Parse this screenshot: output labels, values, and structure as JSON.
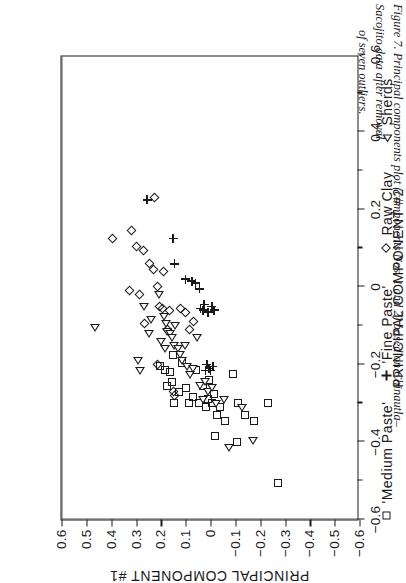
{
  "figure": {
    "caption_line1": "Figure 7. Principal components plot (components Nos. 1 and 2) based on Chinautla–Sacojito data after removal",
    "caption_line2": "of seven outliers."
  },
  "chart_data": {
    "type": "scatter",
    "title": "",
    "xlabel": "PRINCIPAL COMPONENT #2",
    "ylabel": "PRINCIPAL COMPONENT #1",
    "xlim": [
      -0.6,
      0.6
    ],
    "ylim": [
      -0.6,
      0.6
    ],
    "grid": false,
    "zero_lines": true,
    "legend_position": "below-axes",
    "xticks": [
      -0.6,
      -0.4,
      -0.2,
      0,
      0.2,
      0.4,
      0.6
    ],
    "xtick_labels": [
      "−0.6",
      "−0.4",
      "−0.2",
      "0",
      "0.2",
      "0.4",
      "0.6"
    ],
    "xticks_minor": [
      -0.5,
      -0.3,
      -0.1,
      0.1,
      0.3,
      0.5
    ],
    "yticks": [
      -0.6,
      -0.5,
      -0.4,
      -0.3,
      -0.2,
      -0.1,
      0,
      0.1,
      0.2,
      0.3,
      0.4,
      0.5,
      0.6
    ],
    "ytick_labels": [
      "−0.6",
      "−0.5",
      "−0.4",
      "−0.3",
      "−0.2",
      "−0.1",
      "0",
      "0.1",
      "0.2",
      "0.3",
      "0.4",
      "0.5",
      "0.6"
    ],
    "series": [
      {
        "name": "'Medium Paste'",
        "marker": "square",
        "points": [
          [
            0.205,
            -0.205
          ],
          [
            0.185,
            -0.215
          ],
          [
            0.175,
            -0.255
          ],
          [
            0.165,
            -0.22
          ],
          [
            0.155,
            -0.245
          ],
          [
            0.145,
            -0.3
          ],
          [
            0.125,
            -0.27
          ],
          [
            0.115,
            -0.195
          ],
          [
            0.1,
            -0.26
          ],
          [
            0.085,
            -0.3
          ],
          [
            0.07,
            -0.285
          ],
          [
            0.06,
            -0.215
          ],
          [
            0.045,
            -0.3
          ],
          [
            0.03,
            -0.255
          ],
          [
            0.02,
            -0.31
          ],
          [
            0.01,
            -0.29
          ],
          [
            0.005,
            -0.24
          ],
          [
            -0.005,
            -0.3
          ],
          [
            -0.015,
            -0.275
          ],
          [
            -0.025,
            -0.33
          ],
          [
            -0.04,
            -0.31
          ],
          [
            -0.06,
            -0.345
          ],
          [
            -0.09,
            -0.225
          ],
          [
            -0.11,
            -0.3
          ],
          [
            -0.14,
            -0.33
          ],
          [
            -0.175,
            -0.345
          ],
          [
            -0.23,
            -0.3
          ],
          [
            -0.27,
            -0.505
          ],
          [
            -0.02,
            -0.385
          ],
          [
            -0.105,
            -0.4
          ],
          [
            0.15,
            -0.175
          ]
        ]
      },
      {
        "name": "'Fine Paste'",
        "marker": "plus",
        "points": [
          [
            0.255,
            0.225
          ],
          [
            0.15,
            0.125
          ],
          [
            0.145,
            0.06
          ],
          [
            0.075,
            0.015
          ],
          [
            0.06,
            0.01
          ],
          [
            0.045,
            -0.005
          ],
          [
            0.04,
            -0.055
          ],
          [
            0.03,
            -0.06
          ],
          [
            0.025,
            -0.045
          ],
          [
            0.015,
            -0.2
          ],
          [
            0.01,
            -0.065
          ],
          [
            0.005,
            -0.21
          ],
          [
            -0.005,
            -0.05
          ],
          [
            -0.01,
            -0.205
          ],
          [
            -0.015,
            -0.06
          ],
          [
            0.0,
            -0.215
          ],
          [
            0.02,
            -0.215
          ],
          [
            0.1,
            0.02
          ]
        ]
      },
      {
        "name": "Raw Clay",
        "marker": "diamond",
        "points": [
          [
            0.225,
            0.23
          ],
          [
            0.32,
            0.145
          ],
          [
            0.3,
            0.105
          ],
          [
            0.395,
            0.125
          ],
          [
            0.27,
            0.095
          ],
          [
            0.245,
            0.06
          ],
          [
            0.23,
            0.045
          ],
          [
            0.19,
            0.04
          ],
          [
            0.215,
            0.0
          ],
          [
            0.325,
            -0.01
          ],
          [
            0.285,
            -0.02
          ],
          [
            0.205,
            -0.05
          ],
          [
            0.195,
            -0.055
          ],
          [
            0.165,
            -0.06
          ],
          [
            0.12,
            -0.055
          ],
          [
            0.1,
            -0.065
          ],
          [
            0.265,
            -0.095
          ],
          [
            0.175,
            -0.11
          ],
          [
            0.07,
            -0.09
          ],
          [
            0.085,
            -0.11
          ],
          [
            0.215,
            -0.2
          ],
          [
            0.15,
            -0.27
          ],
          [
            0.145,
            -0.28
          ]
        ]
      },
      {
        "name": "Sherds",
        "marker": "triangle",
        "points": [
          [
            0.47,
            -0.105
          ],
          [
            0.3,
            -0.19
          ],
          [
            0.29,
            -0.215
          ],
          [
            0.275,
            -0.05
          ],
          [
            0.245,
            -0.085
          ],
          [
            0.215,
            -0.02
          ],
          [
            0.195,
            -0.075
          ],
          [
            0.185,
            -0.095
          ],
          [
            0.18,
            -0.115
          ],
          [
            0.17,
            -0.12
          ],
          [
            0.16,
            -0.13
          ],
          [
            0.155,
            -0.15
          ],
          [
            0.15,
            -0.1
          ],
          [
            0.135,
            -0.16
          ],
          [
            0.13,
            -0.175
          ],
          [
            0.12,
            -0.19
          ],
          [
            0.11,
            -0.15
          ],
          [
            0.1,
            -0.205
          ],
          [
            0.09,
            -0.225
          ],
          [
            0.075,
            -0.21
          ],
          [
            0.06,
            -0.13
          ],
          [
            0.05,
            -0.255
          ],
          [
            0.03,
            -0.245
          ],
          [
            0.015,
            -0.27
          ],
          [
            0.0,
            -0.26
          ],
          [
            -0.015,
            -0.3
          ],
          [
            -0.05,
            -0.29
          ],
          [
            -0.12,
            -0.31
          ],
          [
            -0.165,
            -0.395
          ],
          [
            0.205,
            -0.14
          ],
          [
            0.19,
            -0.16
          ],
          [
            0.255,
            -0.12
          ],
          [
            0.035,
            -0.29
          ],
          [
            -0.07,
            -0.415
          ]
        ]
      }
    ]
  },
  "legend": {
    "items": [
      {
        "marker": "square",
        "label": "'Medium Paste'"
      },
      {
        "marker": "plus",
        "label": "'Fine Paste'"
      },
      {
        "marker": "diamond",
        "label": "Raw Clay"
      },
      {
        "marker": "triangle",
        "label": "Sherds"
      }
    ]
  }
}
